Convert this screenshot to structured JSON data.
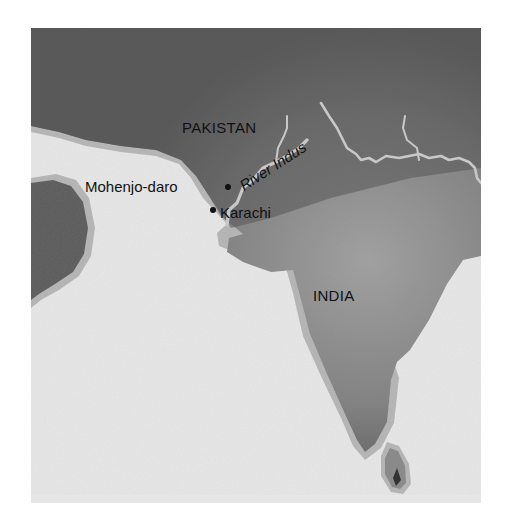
{
  "map": {
    "colors": {
      "sea": "#e6e6e6",
      "land_dark": "#5a5a5a",
      "land_light": "#9a9a9a",
      "coast_band": "#b4b4b4",
      "river": "#c8c8c8",
      "text": "#111111"
    },
    "countries": [
      {
        "name": "PAKISTAN"
      },
      {
        "name": "INDIA"
      }
    ],
    "cities": [
      {
        "name": "Mohenjo-daro"
      },
      {
        "name": "Karachi"
      }
    ],
    "rivers": [
      {
        "name": "River Indus"
      }
    ]
  }
}
